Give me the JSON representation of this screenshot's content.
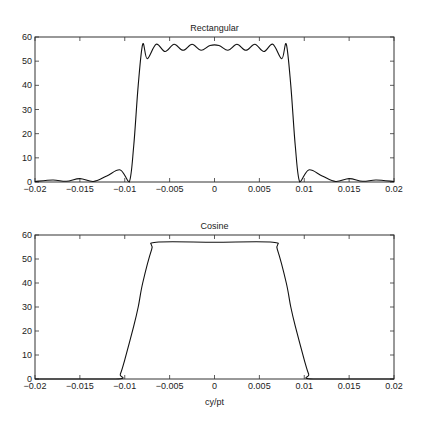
{
  "chart_data": [
    {
      "type": "line",
      "title": "Rectangular",
      "xlabel": "",
      "ylabel": "",
      "xlim": [
        -0.02,
        0.02
      ],
      "ylim": [
        0,
        60
      ],
      "xticks": [
        -0.02,
        -0.015,
        -0.01,
        -0.005,
        0,
        0.005,
        0.01,
        0.015,
        0.02
      ],
      "xtick_labels": [
        "-0.02",
        "-0.015",
        "-0.01",
        "-0.005",
        "0",
        "0.005",
        "0.01",
        "0.015",
        "0.02"
      ],
      "yticks": [
        0,
        10,
        20,
        30,
        40,
        50,
        60
      ],
      "ytick_labels": [
        "0",
        "10",
        "20",
        "30",
        "40",
        "50",
        "60"
      ],
      "grid": false,
      "description": "Magnitude response with Gibbs ripple; passband ~55 between ±0.008, sharp transition near ±0.0085, sidelobes decaying outside ±0.01",
      "x": [
        -0.02,
        -0.018,
        -0.0165,
        -0.015,
        -0.0135,
        -0.012,
        -0.0105,
        -0.0095,
        -0.009,
        -0.0085,
        -0.008,
        -0.0075,
        -0.0065,
        -0.0055,
        -0.0045,
        -0.0035,
        -0.0025,
        -0.0015,
        -0.0005,
        0.0005,
        0.0015,
        0.0025,
        0.0035,
        0.0045,
        0.0055,
        0.0065,
        0.0075,
        0.008,
        0.0085,
        0.009,
        0.0095,
        0.0105,
        0.012,
        0.0135,
        0.015,
        0.0165,
        0.018,
        0.02
      ],
      "values": [
        0.2,
        0.8,
        0.3,
        1.4,
        0.2,
        2.5,
        5.0,
        0.0,
        15,
        40,
        57,
        51,
        57,
        54,
        57,
        54.5,
        57,
        54.5,
        56.5,
        56.5,
        54.5,
        57,
        54.5,
        57,
        54,
        57,
        51,
        57,
        40,
        15,
        0.0,
        5.0,
        2.5,
        0.2,
        1.4,
        0.3,
        0.8,
        0.2
      ]
    },
    {
      "type": "line",
      "title": "Cosine",
      "xlabel": "cy/pt",
      "ylabel": "",
      "xlim": [
        -0.02,
        0.02
      ],
      "ylim": [
        0,
        60
      ],
      "xticks": [
        -0.02,
        -0.015,
        -0.01,
        -0.005,
        0,
        0.005,
        0.01,
        0.015,
        0.02
      ],
      "xtick_labels": [
        "-0.02",
        "-0.015",
        "-0.01",
        "-0.005",
        "0",
        "0.005",
        "0.01",
        "0.015",
        "0.02"
      ],
      "yticks": [
        0,
        10,
        20,
        30,
        40,
        50,
        60
      ],
      "ytick_labels": [
        "0",
        "10",
        "20",
        "30",
        "40",
        "50",
        "60"
      ],
      "grid": false,
      "description": "Smooth raised-cosine taper; flat at ~57 between ±0.0065, falling to 0 at ±0.011",
      "x": [
        -0.02,
        -0.011,
        -0.0105,
        -0.01,
        -0.009,
        -0.0085,
        -0.008,
        -0.007,
        -0.0065,
        0,
        0.0065,
        0.007,
        0.008,
        0.0085,
        0.009,
        0.01,
        0.0105,
        0.011,
        0.02
      ],
      "values": [
        0,
        0,
        2,
        8,
        22,
        30,
        40,
        54,
        57,
        57,
        57,
        54,
        40,
        30,
        22,
        8,
        2,
        0,
        0
      ]
    }
  ]
}
